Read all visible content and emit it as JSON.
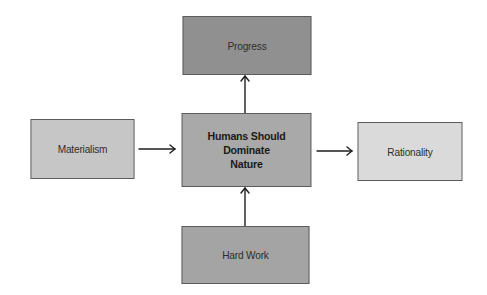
{
  "diagram": {
    "type": "flow",
    "nodes": [
      {
        "id": "progress",
        "label": "Progress",
        "x": 177,
        "y": 16,
        "w": 140,
        "h": 59,
        "fill": "#909090",
        "bold": false
      },
      {
        "id": "center",
        "label": "Humans Should Dominate Nature",
        "lines": [
          "Humans Should",
          "Dominate",
          "Nature"
        ],
        "x": 176,
        "y": 113,
        "w": 141,
        "h": 74,
        "fill": "#a9a9a9",
        "bold": true
      },
      {
        "id": "materialism",
        "label": "Materialism",
        "x": 26,
        "y": 119,
        "w": 113,
        "h": 60,
        "fill": "#c6c6c6",
        "bold": false
      },
      {
        "id": "rationality",
        "label": "Rationality",
        "x": 353,
        "y": 122,
        "w": 114,
        "h": 59,
        "fill": "#dadada",
        "bold": false
      },
      {
        "id": "hardwork",
        "label": "Hard Work",
        "x": 176,
        "y": 226,
        "w": 139,
        "h": 58,
        "fill": "#a4a4a4",
        "bold": false
      }
    ],
    "edges": [
      {
        "from": "center",
        "to": "progress",
        "x1": 245,
        "y1": 113,
        "x2": 245,
        "y2": 76
      },
      {
        "from": "materialism",
        "to": "center",
        "x1": 139,
        "y1": 149,
        "x2": 175,
        "y2": 149
      },
      {
        "from": "center",
        "to": "rationality",
        "x1": 317,
        "y1": 151,
        "x2": 352,
        "y2": 151
      },
      {
        "from": "hardwork",
        "to": "center",
        "x1": 245,
        "y1": 226,
        "x2": 245,
        "y2": 188
      }
    ]
  },
  "labels": {
    "progress": "Progress",
    "center_line1": "Humans Should",
    "center_line2": "Dominate",
    "center_line3": "Nature",
    "materialism": "Materialism",
    "rationality": "Rationality",
    "hardwork": "Hard Work"
  }
}
